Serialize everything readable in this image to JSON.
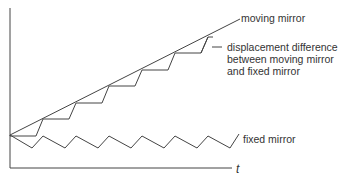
{
  "diagram": {
    "colors": {
      "line": "#444444",
      "text": "#333333",
      "background": "#ffffff"
    },
    "axes": {
      "y_axis": {
        "x": 10,
        "y_top": 8,
        "y_bottom": 168
      },
      "x_axis": {
        "y": 168,
        "x_left": 10,
        "x_right": 232
      },
      "x_label": "t"
    },
    "labels": {
      "moving_mirror": "moving mirror",
      "displacement_line1": "displacement difference",
      "displacement_line2": "between moving mirror",
      "displacement_line3": "and fixed mirror",
      "fixed_mirror": "fixed mirror"
    },
    "series": {
      "moving_mirror": {
        "description": "straight rising line",
        "start": [
          10,
          135
        ],
        "end": [
          240,
          19
        ]
      },
      "displacement_difference": {
        "description": "sawtooth staircase under moving mirror line",
        "period_px": 33,
        "steps": 7
      },
      "fixed_mirror": {
        "description": "zigzag oscillating about constant level",
        "period_px": 33,
        "cycles": 7
      }
    }
  }
}
